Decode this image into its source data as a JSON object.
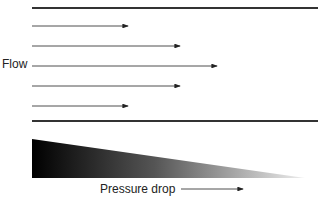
{
  "diagram": {
    "flow_label": "Flow",
    "pressure_label": "Pressure drop",
    "colors": {
      "line": "#222222",
      "gradient_start": "#000000",
      "gradient_end": "#ffffff"
    },
    "arrows": [
      {
        "y": 26,
        "x_end": 128
      },
      {
        "y": 46,
        "x_end": 180
      },
      {
        "y": 66,
        "x_end": 217
      },
      {
        "y": 86,
        "x_end": 180
      },
      {
        "y": 106,
        "x_end": 128
      }
    ]
  }
}
